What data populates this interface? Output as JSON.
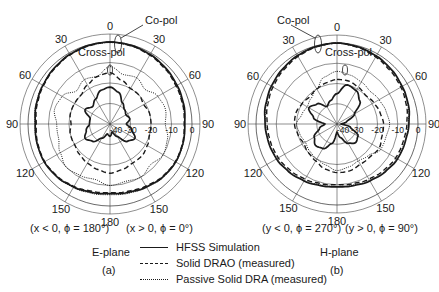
{
  "chart_data": [
    {
      "type": "polar-line",
      "panel": "(a)",
      "plane": "E-plane",
      "caption_left": "(x < 0, ϕ = 180°)",
      "caption_right": "(x > 0, ϕ = 0°)",
      "angle_ticks": [
        0,
        30,
        60,
        90,
        120,
        150,
        180,
        150,
        120,
        90,
        60,
        30
      ],
      "radial_ticks_db": [
        "-40",
        "-30",
        "-20",
        "-10",
        "0"
      ],
      "rlim_db": [
        -40,
        0
      ],
      "annotations": [
        "Co-pol",
        "Cross-pol"
      ],
      "theta_deg": [
        0,
        15,
        30,
        45,
        60,
        75,
        90,
        105,
        120,
        135,
        150,
        165,
        180,
        195,
        210,
        225,
        240,
        255,
        270,
        285,
        300,
        315,
        330,
        345
      ],
      "series": [
        {
          "name": "HFSS Simulation (co-pol)",
          "style": "solid",
          "values_db": [
            0,
            -0.3,
            -0.8,
            -1.5,
            -2.2,
            -2.8,
            -3.5,
            -3.2,
            -3.0,
            -3.5,
            -4.5,
            -5.5,
            -6,
            -5.5,
            -4.5,
            -3.5,
            -3,
            -3.2,
            -3.5,
            -2.8,
            -2.2,
            -1.5,
            -0.8,
            -0.3
          ]
        },
        {
          "name": "Solid DRAO (measured) (co-pol)",
          "style": "dashed",
          "values_db": [
            0,
            -0.5,
            -1.2,
            -2.0,
            -2.8,
            -3.3,
            -3.8,
            -3.4,
            -3.2,
            -3.8,
            -5.0,
            -6.0,
            -6.5,
            -6.0,
            -4.8,
            -3.8,
            -3.2,
            -3.5,
            -4.0,
            -3.2,
            -2.5,
            -1.8,
            -1.0,
            -0.5
          ]
        },
        {
          "name": "Passive Solid DRA (measured) (co-pol)",
          "style": "dotted",
          "values_db": [
            -0.3,
            -0.6,
            -1.0,
            -1.8,
            -2.6,
            -3.2,
            -3.6,
            -3.0,
            -2.8,
            -3.2,
            -4.2,
            -5.0,
            -5.5,
            -5.0,
            -4.2,
            -3.4,
            -2.9,
            -3.1,
            -3.4,
            -2.6,
            -2.0,
            -1.4,
            -0.8,
            -0.4
          ]
        },
        {
          "name": "HFSS Simulation (cross-pol)",
          "style": "solid",
          "values_db": [
            -22,
            -24,
            -28,
            -30,
            -31,
            -30,
            -32,
            -29,
            -26,
            -28,
            -33,
            -36,
            -34,
            -35,
            -32,
            -28,
            -26,
            -28,
            -30,
            -30,
            -26,
            -28,
            -26,
            -23
          ]
        },
        {
          "name": "Solid DRAO (measured) (cross-pol)",
          "style": "dashed",
          "values_db": [
            -15,
            -18,
            -20,
            -20,
            -21,
            -20,
            -20,
            -20,
            -19,
            -18,
            -18,
            -17,
            -16,
            -17,
            -18,
            -19,
            -20,
            -20,
            -21,
            -20,
            -20,
            -20,
            -18,
            -16
          ]
        },
        {
          "name": "Passive Solid DRA (measured) (cross-pol)",
          "style": "dotted",
          "values_db": [
            -12,
            -15,
            -14,
            -16,
            -13,
            -12,
            -13,
            -11,
            -10,
            -12,
            -10,
            -11,
            -10,
            -12,
            -11,
            -10,
            -12,
            -14,
            -14,
            -12,
            -13,
            -17,
            -15,
            -16
          ]
        }
      ]
    },
    {
      "type": "polar-line",
      "panel": "(b)",
      "plane": "H-plane",
      "caption_left": "(y < 0, ϕ = 270°)",
      "caption_right": "(y > 0, ϕ = 90°)",
      "angle_ticks": [
        0,
        30,
        60,
        90,
        120,
        150,
        180,
        150,
        120,
        90,
        60,
        30
      ],
      "radial_ticks_db": [
        "-40",
        "-30",
        "-20",
        "-10",
        "0"
      ],
      "rlim_db": [
        -40,
        0
      ],
      "annotations": [
        "Co-pol",
        "Cross-pol"
      ],
      "theta_deg": [
        0,
        15,
        30,
        45,
        60,
        75,
        90,
        105,
        120,
        135,
        150,
        165,
        180,
        195,
        210,
        225,
        240,
        255,
        270,
        285,
        300,
        315,
        330,
        345
      ],
      "series": [
        {
          "name": "HFSS Simulation (co-pol)",
          "style": "solid",
          "values_db": [
            0,
            -0.5,
            -1.2,
            -2.0,
            -2.8,
            -3.5,
            -4.5,
            -5.2,
            -5.5,
            -6.5,
            -7.5,
            -8.5,
            -9,
            -8.5,
            -7.5,
            -6.5,
            -5.5,
            -5.0,
            -4.5,
            -3.5,
            -2.6,
            -1.8,
            -1.0,
            -0.4
          ]
        },
        {
          "name": "Solid DRAO (measured) (co-pol)",
          "style": "dashed",
          "values_db": [
            0,
            -0.8,
            -1.8,
            -2.8,
            -3.6,
            -4.5,
            -5.5,
            -6.2,
            -6.5,
            -7.5,
            -8.5,
            -9.5,
            -10,
            -9.5,
            -8.5,
            -7.5,
            -6.5,
            -6.0,
            -5.5,
            -4.5,
            -3.5,
            -2.5,
            -1.5,
            -0.6
          ]
        },
        {
          "name": "Passive Solid DRA (measured) (co-pol)",
          "style": "dotted",
          "values_db": [
            -0.2,
            -0.7,
            -1.4,
            -2.2,
            -3.0,
            -3.8,
            -4.8,
            -5.4,
            -5.8,
            -6.8,
            -7.8,
            -8.8,
            -9.2,
            -8.8,
            -7.8,
            -6.8,
            -5.8,
            -5.2,
            -4.8,
            -3.8,
            -2.8,
            -2.0,
            -1.2,
            -0.5
          ]
        },
        {
          "name": "HFSS Simulation (cross-pol)",
          "style": "solid",
          "values_db": [
            -25,
            -20,
            -21,
            -24,
            -30,
            -35,
            -38,
            -33,
            -28,
            -27,
            -29,
            -33,
            -36,
            -30,
            -26,
            -25,
            -27,
            -31,
            -34,
            -28,
            -24,
            -26,
            -30,
            -28
          ]
        },
        {
          "name": "Solid DRAO (measured) (cross-pol)",
          "style": "dashed",
          "values_db": [
            -18,
            -18,
            -19,
            -20,
            -19,
            -18,
            -17,
            -17,
            -16,
            -17,
            -17,
            -16,
            -16,
            -17,
            -19,
            -20,
            -21,
            -20,
            -19,
            -19,
            -20,
            -21,
            -20,
            -19
          ]
        },
        {
          "name": "Passive Solid DRA (measured) (cross-pol)",
          "style": "dotted",
          "values_db": [
            -14,
            -15,
            -16,
            -17,
            -16,
            -15,
            -14,
            -15,
            -15,
            -18,
            -19,
            -18,
            -17,
            -19,
            -20,
            -21,
            -22,
            -21,
            -20,
            -22,
            -23,
            -22,
            -20,
            -16
          ]
        }
      ]
    }
  ],
  "legend": [
    {
      "label": "HFSS Simulation",
      "style": "solid"
    },
    {
      "label": "Solid DRAO (measured)",
      "style": "dashed"
    },
    {
      "label": "Passive Solid DRA (measured)",
      "style": "dotted"
    }
  ],
  "labels": {
    "copol": "Co-pol",
    "crosspol": "Cross-pol",
    "eplane": "E-plane",
    "hplane": "H-plane",
    "panel_a": "(a)",
    "panel_b": "(b)",
    "a_left": "(x < 0, ϕ = 180°)",
    "a_right": "(x > 0, ϕ = 0°)",
    "b_left": "(y < 0, ϕ = 270°)",
    "b_right": "(y > 0, ϕ = 90°)"
  },
  "colors": {
    "ink": "#1a1a1a",
    "grid": "#444444"
  }
}
